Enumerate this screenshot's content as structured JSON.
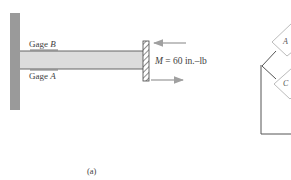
{
  "figure": {
    "caption": "(a)",
    "beam": {
      "gage_top": {
        "prefix": "Gage ",
        "letter": "B"
      },
      "gage_bottom": {
        "prefix": "Gage ",
        "letter": "A"
      },
      "applied_moment": {
        "symbol": "M",
        "equals": " = ",
        "value": "60",
        "unit": " in.–lb"
      }
    },
    "circuit": {
      "nodes": [
        {
          "letter": "A"
        },
        {
          "letter": "C"
        }
      ]
    },
    "colors": {
      "wall_fill": "#9a9a9a",
      "beam_fill": "#dcdcdc",
      "line": "#555555",
      "arrow": "#a0a0a0",
      "hatch": "#444444"
    }
  }
}
